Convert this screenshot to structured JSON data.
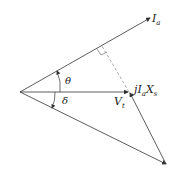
{
  "diagram": {
    "title": "",
    "labels": {
      "ia": "I",
      "ia_sub": "a",
      "theta": "θ",
      "delta": "δ",
      "vt": "V",
      "vt_sub": "t",
      "jiaxs_j": "jI",
      "jiaxs_a": "a",
      "jiaxs_x": "X",
      "jiaxs_s": "s"
    },
    "colors": {
      "line": "#333333",
      "dashed": "#777777"
    }
  }
}
